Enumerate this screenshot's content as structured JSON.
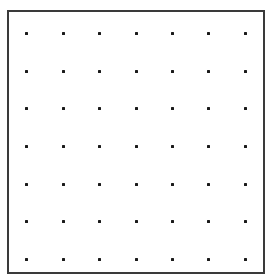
{
  "figure": {
    "kind": "dot-grid",
    "rows": 7,
    "columns": 7,
    "dot_color": "#1a1a1a",
    "border_color": "#3a3a3a",
    "background_color": "#ffffff",
    "column_x": [
      26,
      63,
      99,
      136,
      172,
      208,
      245
    ],
    "row_y": [
      33,
      71,
      108,
      146,
      184,
      221,
      259
    ]
  }
}
